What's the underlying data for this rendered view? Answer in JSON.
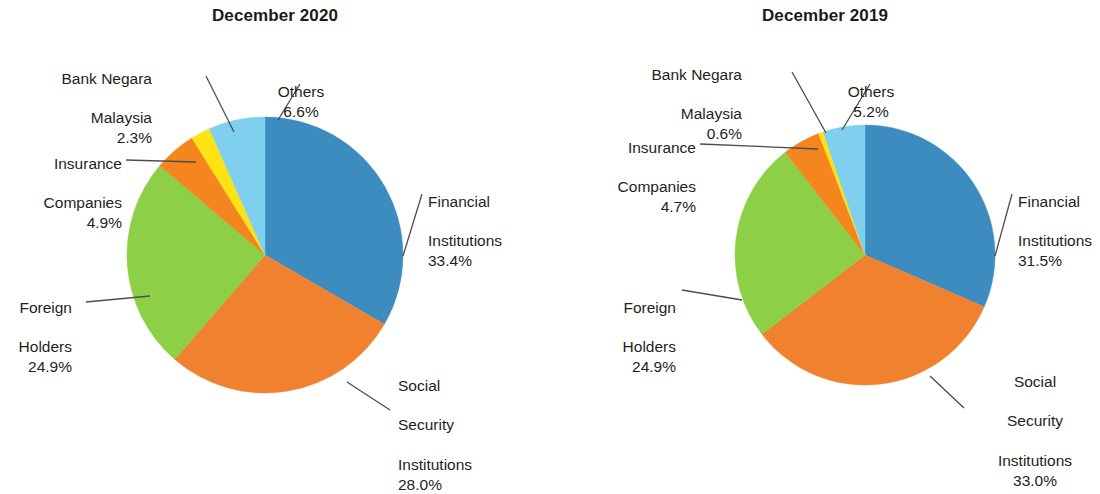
{
  "figure": {
    "background_color": "#ffffff",
    "text_color": "#231f20"
  },
  "palette": {
    "financial_institutions": "#3d8cc0",
    "social_security_institutions": "#f0822f",
    "foreign_holders": "#8dcf46",
    "insurance_companies": "#f5851f",
    "bank_negara_malaysia": "#fde316",
    "others": "#7fcfee",
    "leader_line": "#4d4d4d"
  },
  "chart_data": [
    {
      "type": "pie",
      "title": "December 2020",
      "categories": [
        "Financial Institutions",
        "Social Security Institutions",
        "Foreign Holders",
        "Insurance Companies",
        "Bank Negara Malaysia",
        "Others"
      ],
      "values": [
        33.4,
        28.0,
        24.9,
        4.9,
        2.3,
        6.6
      ],
      "unit": "%",
      "start_angle_deg": 0,
      "direction": "clockwise",
      "colors": [
        "#3d8cc0",
        "#f0822f",
        "#8dcf46",
        "#f5851f",
        "#fde316",
        "#7fcfee"
      ],
      "labels": [
        {
          "name": "Financial Institutions",
          "text": "Financial\nInstitutions",
          "pct": "33.4%"
        },
        {
          "name": "Social Security Institutions",
          "text": "Social\nSecurity\nInstitutions",
          "pct": "28.0%"
        },
        {
          "name": "Foreign Holders",
          "text": "Foreign\nHolders",
          "pct": "24.9%"
        },
        {
          "name": "Insurance Companies",
          "text": "Insurance\nCompanies",
          "pct": "4.9%"
        },
        {
          "name": "Bank Negara Malaysia",
          "text": "Bank Negara\nMalaysia",
          "pct": "2.3%"
        },
        {
          "name": "Others",
          "text": "Others",
          "pct": "6.6%"
        }
      ]
    },
    {
      "type": "pie",
      "title": "December 2019",
      "categories": [
        "Financial Institutions",
        "Social Security Institutions",
        "Foreign Holders",
        "Insurance Companies",
        "Bank Negara Malaysia",
        "Others"
      ],
      "values": [
        31.5,
        33.0,
        24.9,
        4.7,
        0.6,
        5.2
      ],
      "unit": "%",
      "start_angle_deg": 0,
      "direction": "clockwise",
      "colors": [
        "#3d8cc0",
        "#f0822f",
        "#8dcf46",
        "#f5851f",
        "#fde316",
        "#7fcfee"
      ],
      "labels": [
        {
          "name": "Financial Institutions",
          "text": "Financial\nInstitutions",
          "pct": "31.5%"
        },
        {
          "name": "Social Security Institutions",
          "text": "Social\nSecurity\nInstitutions",
          "pct": "33.0%"
        },
        {
          "name": "Foreign Holders",
          "text": "Foreign\nHolders",
          "pct": "24.9%"
        },
        {
          "name": "Insurance Companies",
          "text": "Insurance\nCompanies",
          "pct": "4.7%"
        },
        {
          "name": "Bank Negara Malaysia",
          "text": "Bank Negara\nMalaysia",
          "pct": "0.6%"
        },
        {
          "name": "Others",
          "text": "Others",
          "pct": "5.2%"
        }
      ]
    }
  ],
  "left_chart": {
    "title": "December 2020",
    "labels": {
      "financial_institutions": {
        "line1": "Financial",
        "line2": "Institutions",
        "line3": "",
        "pct": "33.4%"
      },
      "social_security_institutions": {
        "line1": "Social",
        "line2": "Security",
        "line3": "Institutions",
        "pct": "28.0%"
      },
      "foreign_holders": {
        "line1": "Foreign",
        "line2": "Holders",
        "line3": "",
        "pct": "24.9%"
      },
      "insurance_companies": {
        "line1": "Insurance",
        "line2": "Companies",
        "line3": "",
        "pct": "4.9%"
      },
      "bank_negara_malaysia": {
        "line1": "Bank Negara",
        "line2": "Malaysia",
        "line3": "",
        "pct": "2.3%"
      },
      "others": {
        "line1": "Others",
        "line2": "",
        "line3": "",
        "pct": "6.6%"
      }
    }
  },
  "right_chart": {
    "title": "December 2019",
    "labels": {
      "financial_institutions": {
        "line1": "Financial",
        "line2": "Institutions",
        "line3": "",
        "pct": "31.5%"
      },
      "social_security_institutions": {
        "line1": "Social",
        "line2": "Security",
        "line3": "Institutions",
        "pct": "33.0%"
      },
      "foreign_holders": {
        "line1": "Foreign",
        "line2": "Holders",
        "line3": "",
        "pct": "24.9%"
      },
      "insurance_companies": {
        "line1": "Insurance",
        "line2": "Companies",
        "line3": "",
        "pct": "4.7%"
      },
      "bank_negara_malaysia": {
        "line1": "Bank Negara",
        "line2": "Malaysia",
        "line3": "",
        "pct": "0.6%"
      },
      "others": {
        "line1": "Others",
        "line2": "",
        "line3": "",
        "pct": "5.2%"
      }
    }
  }
}
